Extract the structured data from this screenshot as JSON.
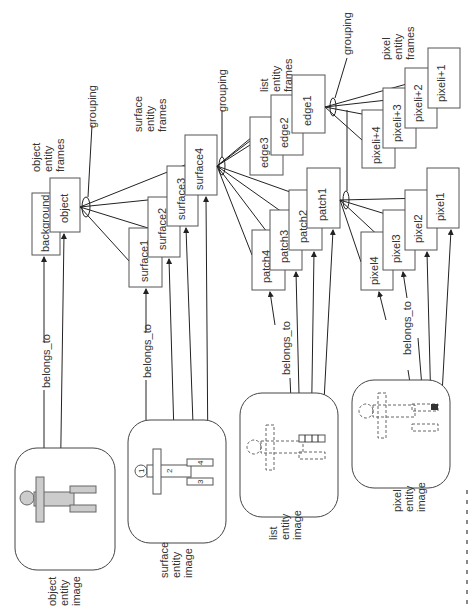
{
  "diagram": {
    "levels": [
      {
        "id": "object",
        "frames_label": [
          "object",
          "entity",
          "frames"
        ],
        "frames": [
          "background",
          "object"
        ],
        "image_label": [
          "object",
          "entity",
          "image"
        ]
      },
      {
        "id": "surface",
        "frames_label": [
          "surface",
          "entity",
          "frames"
        ],
        "frames": [
          "surface1",
          "surface2",
          "surface3",
          "surface4"
        ],
        "image_label": [
          "surface",
          "entity",
          "image"
        ],
        "image_parts": [
          "1",
          "2",
          "3",
          "4"
        ]
      },
      {
        "id": "list",
        "frames_label": [
          "list",
          "entity",
          "frames"
        ],
        "frames": [
          "edge3",
          "edge2",
          "edge1"
        ],
        "patches": [
          "patch4",
          "patch3",
          "patch2",
          "patch1"
        ],
        "image_label": [
          "list",
          "entity",
          "image"
        ]
      },
      {
        "id": "pixel",
        "frames_label": [
          "pixel",
          "entity",
          "frames"
        ],
        "frames": [
          "pixeli+4",
          "pixeli+3",
          "pixeli+2",
          "pixeli+1"
        ],
        "pixels": [
          "pixel4",
          "pixel3",
          "pixel2",
          "pixel1"
        ],
        "image_label": [
          "pixel",
          "entity",
          "image"
        ]
      }
    ],
    "relation_label": "belongs_to",
    "grouping_label": "grouping"
  }
}
